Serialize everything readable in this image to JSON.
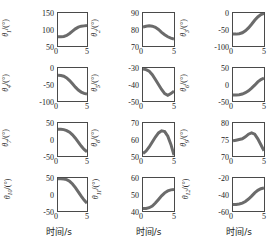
{
  "figure": {
    "layout": "4 rows x 3 columns of line subplots",
    "xlabel": "时间/s",
    "xlabel_cols": [
      "时间/s",
      "时间/s",
      "时间/s"
    ],
    "line_color": "#6b6b6b",
    "axis_color": "#4a4a4a",
    "background": "#ffffff"
  },
  "chart_data": [
    {
      "type": "line",
      "title": "",
      "ylabel": "θ1/(°)",
      "ylabel_symbol": "θ",
      "ylabel_index": "1",
      "ylabel_unit": "/(°)",
      "xlabel": "时间/s",
      "xlim": [
        0,
        5
      ],
      "ylim": [
        50,
        150
      ],
      "xticks": [
        0,
        5
      ],
      "yticks": [
        50,
        100,
        150
      ],
      "grid": false,
      "x": [
        0,
        0.5,
        1,
        1.5,
        2,
        2.5,
        3,
        3.5,
        4,
        4.5,
        5
      ],
      "values": [
        78,
        78,
        79,
        82,
        88,
        95,
        102,
        107,
        110,
        111,
        112
      ]
    },
    {
      "type": "line",
      "title": "",
      "ylabel": "θ2/(°)",
      "ylabel_symbol": "θ",
      "ylabel_index": "2",
      "ylabel_unit": "/(°)",
      "xlabel": "时间/s",
      "xlim": [
        0,
        5
      ],
      "ylim": [
        70,
        90
      ],
      "xticks": [
        0,
        5
      ],
      "yticks": [
        70,
        80,
        90
      ],
      "grid": false,
      "x": [
        0,
        0.5,
        1,
        1.5,
        2,
        2.5,
        3,
        3.5,
        4,
        4.5,
        5
      ],
      "values": [
        81.5,
        82,
        82.2,
        82,
        81.3,
        80,
        78.3,
        76.8,
        75.6,
        74.8,
        74.2
      ]
    },
    {
      "type": "line",
      "title": "",
      "ylabel": "θ3/(°)",
      "ylabel_symbol": "θ",
      "ylabel_index": "3",
      "ylabel_unit": "/(°)",
      "xlabel": "时间/s",
      "xlim": [
        0,
        5
      ],
      "ylim": [
        -100,
        0
      ],
      "xticks": [
        0,
        5
      ],
      "yticks": [
        -100,
        -50,
        0
      ],
      "grid": false,
      "x": [
        0,
        0.5,
        1,
        1.5,
        2,
        2.5,
        3,
        3.5,
        4,
        4.5,
        5
      ],
      "values": [
        -64,
        -64,
        -63,
        -60,
        -54,
        -45,
        -34,
        -22,
        -12,
        -5,
        -1
      ]
    },
    {
      "type": "line",
      "title": "",
      "ylabel": "θ4/(°)",
      "ylabel_symbol": "θ",
      "ylabel_index": "4",
      "ylabel_unit": "/(°)",
      "xlabel": "时间/s",
      "xlim": [
        0,
        5
      ],
      "ylim": [
        -100,
        0
      ],
      "xticks": [
        0,
        5
      ],
      "yticks": [
        -100,
        -50,
        0
      ],
      "grid": false,
      "x": [
        0,
        0.5,
        1,
        1.5,
        2,
        2.5,
        3,
        3.5,
        4,
        4.5,
        5
      ],
      "values": [
        -22,
        -23,
        -25,
        -30,
        -38,
        -48,
        -58,
        -67,
        -73,
        -77,
        -79
      ]
    },
    {
      "type": "line",
      "title": "",
      "ylabel": "θ5/(°)",
      "ylabel_symbol": "θ",
      "ylabel_index": "5",
      "ylabel_unit": "/(°)",
      "xlabel": "时间/s",
      "xlim": [
        0,
        5
      ],
      "ylim": [
        -50,
        -30
      ],
      "xticks": [
        0,
        5
      ],
      "yticks": [
        -50,
        -40,
        -30
      ],
      "grid": false,
      "x": [
        0,
        0.5,
        1,
        1.5,
        2,
        2.5,
        3,
        3.5,
        4,
        4.5,
        5
      ],
      "values": [
        -30.5,
        -31,
        -32,
        -34,
        -37,
        -40,
        -43,
        -45.5,
        -46.5,
        -45.5,
        -44
      ]
    },
    {
      "type": "line",
      "title": "",
      "ylabel": "θ6/(°)",
      "ylabel_symbol": "θ",
      "ylabel_index": "6",
      "ylabel_unit": "/(°)",
      "xlabel": "时间/s",
      "xlim": [
        0,
        5
      ],
      "ylim": [
        -50,
        50
      ],
      "xticks": [
        0,
        5
      ],
      "yticks": [
        -50,
        0,
        50
      ],
      "grid": false,
      "x": [
        0,
        0.5,
        1,
        1.5,
        2,
        2.5,
        3,
        3.5,
        4,
        4.5,
        5
      ],
      "values": [
        -32,
        -32,
        -31,
        -29,
        -25,
        -19,
        -11,
        -2,
        8,
        15,
        19
      ]
    },
    {
      "type": "line",
      "title": "",
      "ylabel": "θ7/(°)",
      "ylabel_symbol": "θ",
      "ylabel_index": "7",
      "ylabel_unit": "/(°)",
      "xlabel": "时间/s",
      "xlim": [
        0,
        5
      ],
      "ylim": [
        -50,
        50
      ],
      "xticks": [
        0,
        5
      ],
      "yticks": [
        -50,
        0,
        50
      ],
      "grid": false,
      "x": [
        0,
        0.5,
        1,
        1.5,
        2,
        2.5,
        3,
        3.5,
        4,
        4.5,
        5
      ],
      "values": [
        31,
        31,
        30,
        27,
        22,
        14,
        4,
        -8,
        -20,
        -30,
        -37
      ]
    },
    {
      "type": "line",
      "title": "",
      "ylabel": "θ8/(°)",
      "ylabel_symbol": "θ",
      "ylabel_index": "8",
      "ylabel_unit": "/(°)",
      "xlabel": "时间/s",
      "xlim": [
        0,
        5
      ],
      "ylim": [
        50,
        70
      ],
      "xticks": [
        0,
        5
      ],
      "yticks": [
        50,
        60,
        70
      ],
      "grid": false,
      "x": [
        0,
        0.5,
        1,
        1.5,
        2,
        2.5,
        3,
        3.5,
        4,
        4.5,
        5
      ],
      "values": [
        51.5,
        53,
        55.5,
        58.5,
        61.5,
        64,
        65.3,
        64.8,
        62,
        57,
        50.5
      ]
    },
    {
      "type": "line",
      "title": "",
      "ylabel": "θ9/(°)",
      "ylabel_symbol": "θ",
      "ylabel_index": "9",
      "ylabel_unit": "/(°)",
      "xlabel": "时间/s",
      "xlim": [
        0,
        5
      ],
      "ylim": [
        70,
        80
      ],
      "xticks": [
        0,
        5
      ],
      "yticks": [
        70,
        75,
        80
      ],
      "grid": false,
      "x": [
        0,
        0.5,
        1,
        1.5,
        2,
        2.5,
        3,
        3.5,
        4,
        4.5,
        5
      ],
      "values": [
        74.6,
        74.8,
        75,
        75.2,
        75.8,
        76.6,
        77,
        76.6,
        75.2,
        73.4,
        71.6
      ]
    },
    {
      "type": "line",
      "title": "",
      "ylabel": "θ10/(°)",
      "ylabel_symbol": "θ",
      "ylabel_index": "10",
      "ylabel_unit": "/(°)",
      "xlabel": "时间/s",
      "xlim": [
        0,
        5
      ],
      "ylim": [
        -50,
        50
      ],
      "xticks": [
        0,
        5
      ],
      "yticks": [
        -50,
        0,
        50
      ],
      "grid": false,
      "x": [
        0,
        0.5,
        1,
        1.5,
        2,
        2.5,
        3,
        3.5,
        4,
        4.5,
        5
      ],
      "values": [
        48,
        48,
        47,
        45,
        40,
        32,
        21,
        8,
        -5,
        -17,
        -26
      ]
    },
    {
      "type": "line",
      "title": "",
      "ylabel": "θ11/(°)",
      "ylabel_symbol": "θ",
      "ylabel_index": "11",
      "ylabel_unit": "/(°)",
      "xlabel": "时间/s",
      "xlim": [
        0,
        5
      ],
      "ylim": [
        40,
        60
      ],
      "xticks": [
        0,
        5
      ],
      "yticks": [
        40,
        50,
        60
      ],
      "grid": false,
      "x": [
        0,
        0.5,
        1,
        1.5,
        2,
        2.5,
        3,
        3.5,
        4,
        4.5,
        5
      ],
      "values": [
        41.5,
        41.5,
        42,
        43,
        44.8,
        47,
        49.2,
        51,
        52.2,
        52.8,
        53
      ]
    },
    {
      "type": "line",
      "title": "",
      "ylabel": "θ12/(°)",
      "ylabel_symbol": "θ",
      "ylabel_index": "12",
      "ylabel_unit": "/(°)",
      "xlabel": "时间/s",
      "xlim": [
        0,
        5
      ],
      "ylim": [
        -60,
        -20
      ],
      "xticks": [
        0,
        5
      ],
      "yticks": [
        -60,
        -40,
        -20
      ],
      "grid": false,
      "x": [
        0,
        0.5,
        1,
        1.5,
        2,
        2.5,
        3,
        3.5,
        4,
        4.5,
        5
      ],
      "values": [
        -52,
        -52,
        -51.5,
        -50.5,
        -48.5,
        -45.5,
        -42,
        -38,
        -35,
        -33,
        -32
      ]
    }
  ]
}
